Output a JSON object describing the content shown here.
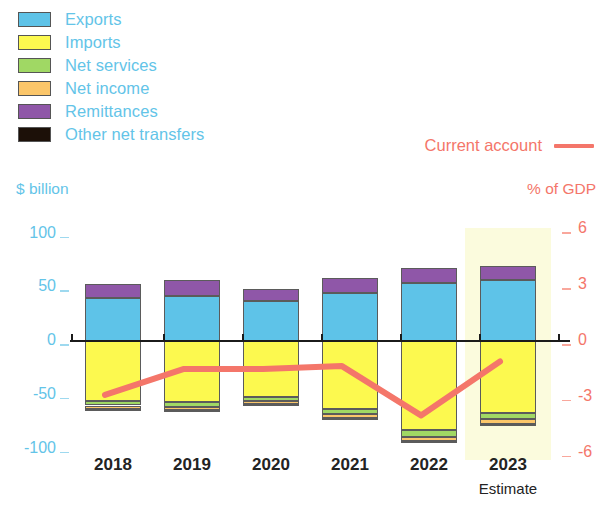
{
  "legend": {
    "items": [
      {
        "label": "Exports",
        "color": "#5ec3e8",
        "key": "exports"
      },
      {
        "label": "Imports",
        "color": "#fcf94f",
        "key": "imports"
      },
      {
        "label": "Net services",
        "color": "#a0d864",
        "key": "net_services"
      },
      {
        "label": "Net income",
        "color": "#fbc66a",
        "key": "net_income"
      },
      {
        "label": "Remittances",
        "color": "#8f57a8",
        "key": "remittances"
      },
      {
        "label": "Other net transfers",
        "color": "#1c1008",
        "key": "other_net_transfers"
      }
    ],
    "line_series_label": "Current account",
    "line_series_color": "#f4766a"
  },
  "axes": {
    "left_unit": "$ billion",
    "right_unit": "% of GDP",
    "left_ticks": [
      "100",
      "50",
      "0",
      "-50",
      "-100"
    ],
    "left_tick_values": [
      100,
      50,
      0,
      -50,
      -100
    ],
    "right_ticks": [
      "6",
      "3",
      "0",
      "-3",
      "-6"
    ],
    "right_tick_values": [
      6,
      3,
      0,
      -3,
      -6
    ],
    "left_color": "#63c4e8",
    "right_color": "#f4766a"
  },
  "xaxis": {
    "categories": [
      "2018",
      "2019",
      "2020",
      "2021",
      "2022",
      "2023"
    ],
    "sublabels": [
      "",
      "",
      "",
      "",
      "",
      "Estimate"
    ]
  },
  "highlight": {
    "category": "2023",
    "color": "#fbfbdd"
  },
  "chart_data": {
    "type": "bar",
    "title": "",
    "xlabel": "",
    "ylabel": "$ billion",
    "y2label": "% of GDP",
    "ylim": [
      -110,
      105
    ],
    "y2lim": [
      -6.6,
      6.3
    ],
    "grid": false,
    "legend_position": "top-left",
    "stacked": true,
    "categories": [
      "2018",
      "2019",
      "2020",
      "2021",
      "2022",
      "2023"
    ],
    "series": [
      {
        "name": "Exports",
        "color": "#5ec3e8",
        "values": [
          40,
          42,
          37,
          45,
          54,
          57
        ]
      },
      {
        "name": "Remittances",
        "color": "#8f57a8",
        "values": [
          13,
          15,
          11,
          14,
          14,
          13
        ]
      },
      {
        "name": "Imports",
        "color": "#fcf94f",
        "values": [
          -56,
          -57,
          -52,
          -63,
          -83,
          -67
        ]
      },
      {
        "name": "Net services",
        "color": "#a0d864",
        "values": [
          -4,
          -4,
          -4,
          -5,
          -6,
          -6
        ]
      },
      {
        "name": "Net income",
        "color": "#fbc66a",
        "values": [
          -3,
          -3,
          -3,
          -4,
          -4,
          -4
        ]
      },
      {
        "name": "Other net transfers",
        "color": "#1c1008",
        "values": [
          -0.5,
          -0.5,
          -0.5,
          -0.5,
          -0.5,
          -0.5
        ]
      }
    ],
    "line_series": {
      "name": "Current account",
      "color": "#f4766a",
      "unit": "% of GDP",
      "axis": "right",
      "values": [
        -2.9,
        -1.5,
        -1.5,
        -1.35,
        -4.0,
        -1.1
      ]
    }
  }
}
